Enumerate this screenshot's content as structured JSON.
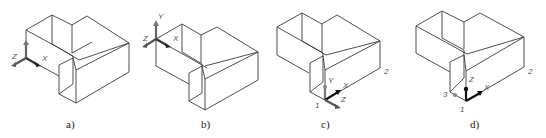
{
  "figure": {
    "panels": [
      {
        "id": "a",
        "caption": "a)",
        "axis_labels": {
          "x": "X",
          "z": "Z",
          "y": "Y"
        },
        "point_labels": []
      },
      {
        "id": "b",
        "caption": "b)",
        "axis_labels": {
          "x": "X",
          "z": "Z",
          "y": "Y"
        },
        "point_labels": []
      },
      {
        "id": "c",
        "caption": "c)",
        "axis_labels": {
          "x": "X",
          "z": "Z",
          "y": "Y"
        },
        "point_labels": [
          "1",
          "2"
        ]
      },
      {
        "id": "d",
        "caption": "d)",
        "axis_labels": {
          "x": "X",
          "z": "Z"
        },
        "point_labels": [
          "1",
          "2",
          "3"
        ]
      }
    ],
    "colors": {
      "edge": "#3a3a3a",
      "axis": "#4a4a4a",
      "axis_dark": "#111111",
      "background": "#ffffff"
    }
  }
}
